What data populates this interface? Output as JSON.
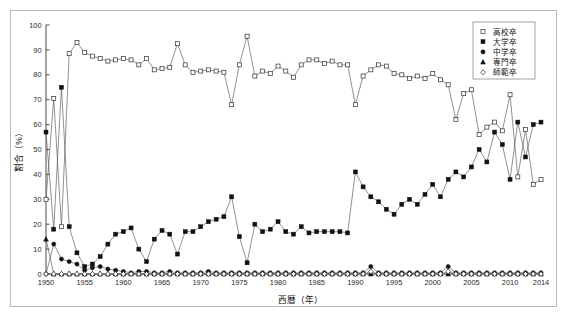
{
  "chart_data": {
    "type": "line",
    "title": "",
    "xlabel": "西暦（年）",
    "ylabel": "割合（%）",
    "xlim": [
      1950,
      2014
    ],
    "ylim": [
      0,
      100
    ],
    "grid": false,
    "legend_position": "top-right",
    "x_tick_labels": [
      "1950",
      "1955",
      "1960",
      "1965",
      "1970",
      "1975",
      "1980",
      "1985",
      "1990",
      "1995",
      "2000",
      "2005",
      "2010",
      "2014"
    ],
    "x_tick_values": [
      1950,
      1955,
      1960,
      1965,
      1970,
      1975,
      1980,
      1985,
      1990,
      1995,
      2000,
      2005,
      2010,
      2014
    ],
    "y_tick_labels": [
      "0",
      "10",
      "20",
      "30",
      "40",
      "50",
      "60",
      "70",
      "80",
      "90",
      "100"
    ],
    "y_tick_values": [
      0,
      10,
      20,
      30,
      40,
      50,
      60,
      70,
      80,
      90,
      100
    ],
    "x": [
      1950,
      1951,
      1952,
      1953,
      1954,
      1955,
      1956,
      1957,
      1958,
      1959,
      1960,
      1961,
      1962,
      1963,
      1964,
      1965,
      1966,
      1967,
      1968,
      1969,
      1970,
      1971,
      1972,
      1973,
      1974,
      1975,
      1976,
      1977,
      1978,
      1979,
      1980,
      1981,
      1982,
      1983,
      1984,
      1985,
      1986,
      1987,
      1988,
      1989,
      1990,
      1991,
      1992,
      1993,
      1994,
      1995,
      1996,
      1997,
      1998,
      1999,
      2000,
      2001,
      2002,
      2003,
      2004,
      2005,
      2006,
      2007,
      2008,
      2009,
      2010,
      2011,
      2012,
      2013,
      2014
    ],
    "series": [
      {
        "name": "高校卒",
        "marker": "open-square",
        "values": [
          30,
          70.5,
          19,
          88.5,
          93,
          89,
          87.5,
          86.5,
          85.5,
          86,
          86.5,
          86,
          84,
          86.5,
          82,
          82.5,
          83,
          92.5,
          84,
          81,
          81.5,
          82,
          81.5,
          81,
          68,
          84,
          95.5,
          79.5,
          81.5,
          80.5,
          83.5,
          81.5,
          79,
          84,
          86,
          86,
          84.5,
          85.5,
          84,
          84,
          68,
          79.5,
          82,
          84,
          83.5,
          80.5,
          80,
          78.5,
          79.5,
          78.5,
          80.5,
          78,
          76,
          62,
          72.5,
          74,
          56,
          59,
          61,
          57.5,
          72,
          39,
          58,
          36,
          38
        ]
      },
      {
        "name": "大学卒",
        "marker": "filled-square",
        "values": [
          57,
          18,
          75,
          19,
          8.5,
          3,
          4,
          7,
          12,
          16,
          17,
          18.5,
          10,
          5,
          14,
          17.5,
          16,
          8,
          17,
          17,
          19,
          21,
          22,
          23,
          31,
          15,
          4.5,
          20,
          17,
          18,
          21,
          17,
          16,
          19,
          16.5,
          17,
          17,
          17,
          17,
          16.5,
          41,
          35,
          31,
          29,
          26,
          24,
          28,
          30,
          28,
          32,
          36,
          31,
          38,
          41,
          39,
          43,
          50,
          45,
          57,
          52,
          38,
          61,
          47,
          60,
          61
        ]
      },
      {
        "name": "中学卒",
        "marker": "filled-circle",
        "values": [
          0,
          12,
          6,
          5,
          4,
          1.5,
          2.5,
          3,
          2,
          1.5,
          1,
          0.5,
          1,
          1,
          0.5,
          0.5,
          1,
          0.5,
          0.5,
          0.5,
          0.5,
          1,
          0.5,
          0.5,
          0.5,
          0.5,
          0.5,
          0.5,
          0.5,
          0.5,
          0.5,
          0.5,
          0.5,
          0.5,
          0.5,
          0.5,
          0.5,
          0.5,
          0.5,
          0.5,
          0.5,
          0.5,
          3,
          0.5,
          0.5,
          0.5,
          0.5,
          0.5,
          0.5,
          0.5,
          0.5,
          0.5,
          3,
          0.5,
          0.5,
          0.5,
          0.5,
          0.5,
          0.5,
          0.5,
          0.5,
          0.5,
          0.5,
          0.5,
          0.5
        ]
      },
      {
        "name": "専門卒",
        "marker": "filled-triangle",
        "values": [
          14,
          0,
          0,
          0,
          0,
          0,
          0,
          0,
          0,
          0,
          0,
          0,
          0,
          0,
          0,
          0,
          0,
          0,
          0,
          0,
          0,
          0,
          0,
          0,
          0,
          0,
          0,
          0,
          0,
          0,
          0,
          0,
          0,
          0,
          0,
          0,
          0,
          0,
          0,
          0,
          0,
          0,
          0,
          0,
          0,
          0,
          0,
          0,
          0,
          0,
          0,
          0,
          0,
          0,
          0,
          0,
          0,
          0,
          0,
          0,
          0,
          0,
          0,
          0,
          0
        ]
      },
      {
        "name": "師範卒",
        "marker": "open-diamond",
        "values": [
          0,
          0,
          0,
          0,
          0,
          0,
          0,
          0,
          0,
          0,
          0,
          0,
          0,
          0,
          0,
          0,
          0,
          0,
          0,
          0,
          0,
          0,
          0,
          0,
          0,
          0,
          0,
          0,
          0,
          0,
          0,
          0,
          0,
          0,
          0,
          0,
          0,
          0,
          0,
          0,
          0,
          0,
          1,
          0,
          0,
          0,
          0,
          0,
          0,
          0,
          0,
          0,
          1,
          0,
          0,
          0,
          0,
          0,
          0,
          0,
          0,
          0,
          0,
          0,
          0
        ]
      }
    ]
  },
  "legend": {
    "items": [
      {
        "label": "高校卒",
        "marker": "open-square"
      },
      {
        "label": "大学卒",
        "marker": "filled-square"
      },
      {
        "label": "中学卒",
        "marker": "filled-circle"
      },
      {
        "label": "専門卒",
        "marker": "filled-triangle"
      },
      {
        "label": "師範卒",
        "marker": "open-diamond"
      }
    ]
  },
  "axes": {
    "y_title": "割合（%）",
    "x_title": "西暦（年）"
  }
}
